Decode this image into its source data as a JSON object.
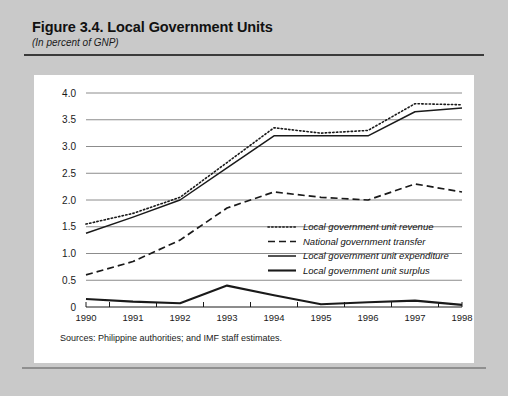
{
  "figure": {
    "title": "Figure 3.4.  Local Government Units",
    "subtitle": "(In percent of GNP)",
    "source_note": "Sources:  Philippine authorities; and IMF staff estimates."
  },
  "colors": {
    "page_background": "#c9c9c9",
    "panel_background": "#ffffff",
    "gridline": "#8c8c8c",
    "line": "#1a1a1a",
    "rule": "#3a3a3a"
  },
  "chart_data": {
    "type": "line",
    "title": "Figure 3.4.  Local Government Units",
    "subtitle": "(In percent of GNP)",
    "xlabel": "",
    "ylabel": "",
    "x": [
      1990,
      1991,
      1992,
      1993,
      1994,
      1995,
      1996,
      1997,
      1998
    ],
    "categories": [
      "1990",
      "1991",
      "1992",
      "1993",
      "1994",
      "1995",
      "1996",
      "1997",
      "1998"
    ],
    "xlim": [
      1990,
      1998
    ],
    "ylim": [
      0,
      4.0
    ],
    "yticks": [
      0,
      0.5,
      1.0,
      1.5,
      2.0,
      2.5,
      3.0,
      3.5,
      4.0
    ],
    "ytick_labels": [
      "0",
      "0.5",
      "1.0",
      "1.5",
      "2.0",
      "2.5",
      "3.0",
      "3.5",
      "4.0"
    ],
    "grid": true,
    "legend_position": "center-right",
    "series": [
      {
        "name": "Local government unit revenue",
        "style": "dotted",
        "values": [
          1.55,
          1.75,
          2.05,
          2.7,
          3.35,
          3.25,
          3.3,
          3.8,
          3.78
        ]
      },
      {
        "name": "National government transfer",
        "style": "dashed",
        "values": [
          0.6,
          0.85,
          1.25,
          1.85,
          2.15,
          2.05,
          2.0,
          2.3,
          2.15
        ]
      },
      {
        "name": "Local government unit expenditure",
        "style": "solid-thin",
        "values": [
          1.38,
          1.68,
          2.0,
          2.6,
          3.2,
          3.2,
          3.2,
          3.65,
          3.72
        ]
      },
      {
        "name": "Local government unit surplus",
        "style": "solid-thick",
        "values": [
          0.15,
          0.1,
          0.07,
          0.4,
          0.22,
          0.05,
          0.09,
          0.12,
          0.04
        ]
      }
    ]
  }
}
